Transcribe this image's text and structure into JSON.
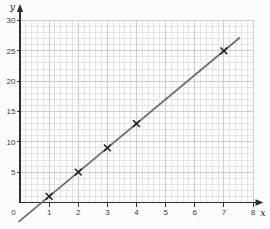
{
  "figure": {
    "name": "straight-line-graph"
  },
  "chart_data": {
    "type": "line",
    "title": "",
    "xlabel": "x",
    "ylabel": "y",
    "origin_label": "0",
    "xlim": [
      0,
      8
    ],
    "ylim": [
      0,
      30
    ],
    "x_major_ticks": [
      1,
      2,
      3,
      4,
      5,
      6,
      7,
      8
    ],
    "y_major_ticks": [
      5,
      10,
      15,
      20,
      25,
      30
    ],
    "x_minor_per_unit": 5,
    "y_minor_step": 1,
    "grid": true,
    "legend": false,
    "marker": "x",
    "points": [
      [
        1,
        1
      ],
      [
        2,
        5
      ],
      [
        3,
        9
      ],
      [
        4,
        13
      ],
      [
        7,
        25
      ]
    ],
    "line_start": [
      -0.05,
      -3.2
    ],
    "line_end": [
      7.55,
      27.2
    ],
    "colors": {
      "background": "#fcfcfc",
      "grid_minor": "#e4e4e4",
      "grid_major": "#cdcdcd",
      "axis": "#2e2e2e",
      "tick_label": "#3a3a3a",
      "line": "#6f6f6f",
      "marker": "#1b1b1b"
    }
  }
}
